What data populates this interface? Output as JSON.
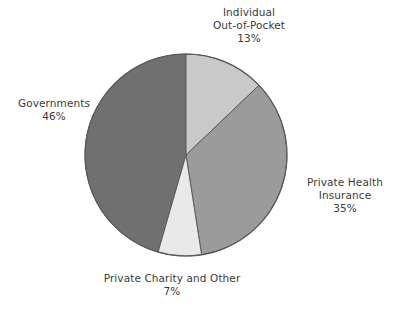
{
  "chart_data": {
    "type": "pie",
    "title": "",
    "subtitle": "",
    "xlabel": "",
    "ylabel": "",
    "legend_position": "none",
    "grid": false,
    "start_angle_deg": 0,
    "direction": "clockwise",
    "categories": [
      "Individual Out-of-Pocket",
      "Private Health Insurance",
      "Private Charity and Other",
      "Governments"
    ],
    "values": [
      13,
      35,
      7,
      46
    ],
    "value_labels": [
      "13%",
      "35%",
      "7%",
      "46%"
    ],
    "units": "percent",
    "total": 101,
    "colors": [
      "#c9c9c9",
      "#9b9b9b",
      "#e9e9e9",
      "#707070"
    ],
    "slices": [
      {
        "name": "Individual Out-of-Pocket",
        "value": 13,
        "value_label": "13%",
        "color": "#c9c9c9",
        "label_lines": [
          "Individual",
          "Out-of-Pocket",
          "13%"
        ]
      },
      {
        "name": "Private Health Insurance",
        "value": 35,
        "value_label": "35%",
        "color": "#9b9b9b",
        "label_lines": [
          "Private Health",
          "Insurance",
          "35%"
        ]
      },
      {
        "name": "Private Charity and Other",
        "value": 7,
        "value_label": "7%",
        "color": "#e9e9e9",
        "label_lines": [
          "Private Charity and Other",
          "7%"
        ]
      },
      {
        "name": "Governments",
        "value": 46,
        "value_label": "46%",
        "color": "#707070",
        "label_lines": [
          "Governments",
          "46%"
        ]
      }
    ]
  },
  "labels": {
    "individual": {
      "line1": "Individual",
      "line2": "Out-of-Pocket",
      "line3": "13%"
    },
    "governments": {
      "line1": "Governments",
      "line2": "46%"
    },
    "private_health": {
      "line1": "Private Health",
      "line2": "Insurance",
      "line3": "35%"
    },
    "private_charity": {
      "line1": "Private Charity and Other",
      "line2": "7%"
    }
  },
  "style": {
    "background": "#ffffff",
    "text_color": "#3a3a3a",
    "slice_outline": "#5a5a5a"
  }
}
